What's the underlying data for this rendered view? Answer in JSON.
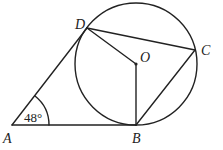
{
  "diagram": {
    "type": "geometry",
    "points": {
      "A": {
        "label": "A",
        "x": 12,
        "y": 125
      },
      "B": {
        "label": "B",
        "x": 136,
        "y": 125
      },
      "C": {
        "label": "C",
        "x": 195,
        "y": 50
      },
      "D": {
        "label": "D",
        "x": 87,
        "y": 28
      },
      "O": {
        "label": "O",
        "x": 136,
        "y": 64
      }
    },
    "circle": {
      "center": "O",
      "cx": 136,
      "cy": 64,
      "r": 61
    },
    "segments": [
      [
        "A",
        "B"
      ],
      [
        "A",
        "D"
      ],
      [
        "D",
        "C"
      ],
      [
        "C",
        "B"
      ],
      [
        "D",
        "O"
      ],
      [
        "O",
        "B"
      ]
    ],
    "angle_annotation": {
      "vertex": "A",
      "value": "48°"
    },
    "colors": {
      "stroke": "#222222",
      "background": "#ffffff"
    }
  }
}
